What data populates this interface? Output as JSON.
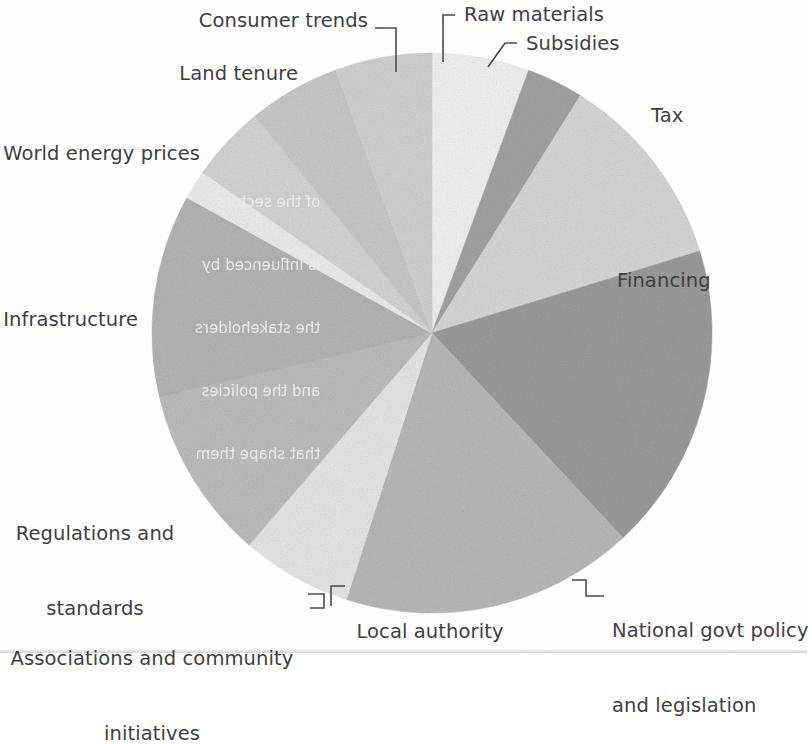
{
  "figure": {
    "type": "pie-chart",
    "background_color": "#ffffff",
    "text_color": "#3f3f3f"
  },
  "chart_data": {
    "type": "pie",
    "title": "",
    "subtitle": "",
    "xlabel": "",
    "ylabel": "",
    "grid": false,
    "legend_position": "none",
    "label_style": "leader-line callouts around pie",
    "start_angle_deg": 0,
    "direction": "clockwise",
    "center_px": [
      432,
      333
    ],
    "radius_px": 280,
    "labels": [
      "Raw materials",
      "Subsidies",
      "Tax",
      "Financing",
      "National govt policy and legislation",
      "Local authority",
      "Associations and community initiatives",
      "Regulations and standards",
      "Infrastructure",
      "World energy prices",
      "Land tenure",
      "Consumer trends"
    ],
    "values": [
      5.6,
      3.3,
      11.4,
      17.8,
      16.9,
      6.4,
      10.0,
      11.7,
      1.7,
      4.4,
      5.3,
      5.5
    ],
    "colors": [
      "#f1f1f1",
      "#a2a2a2",
      "#d7d7d7",
      "#9b9b9b",
      "#b9b9b9",
      "#e7e7e7",
      "#bdbdbd",
      "#b4b4b4",
      "#ededed",
      "#d4d4d4",
      "#c9c9c9",
      "#d1d1d1"
    ],
    "slices": [
      {
        "label": "Raw materials",
        "value": 5.6,
        "color": "#f1f1f1",
        "start_deg": 0.0,
        "end_deg": 20.2
      },
      {
        "label": "Subsidies",
        "value": 3.3,
        "color": "#a2a2a2",
        "start_deg": 20.2,
        "end_deg": 32.0
      },
      {
        "label": "Tax",
        "value": 11.4,
        "color": "#d7d7d7",
        "start_deg": 32.0,
        "end_deg": 73.0
      },
      {
        "label": "Financing",
        "value": 17.8,
        "color": "#9b9b9b",
        "start_deg": 73.0,
        "end_deg": 137.0
      },
      {
        "label": "National govt policy and legislation",
        "value": 16.9,
        "color": "#b9b9b9",
        "start_deg": 137.0,
        "end_deg": 197.8
      },
      {
        "label": "Local authority",
        "value": 6.4,
        "color": "#e7e7e7",
        "start_deg": 197.8,
        "end_deg": 220.8
      },
      {
        "label": "Associations and community initiatives",
        "value": 10.0,
        "color": "#bdbdbd",
        "start_deg": 220.8,
        "end_deg": 256.8
      },
      {
        "label": "Regulations and standards",
        "value": 11.7,
        "color": "#b4b4b4",
        "start_deg": 256.8,
        "end_deg": 298.9
      },
      {
        "label": "Infrastructure",
        "value": 1.7,
        "color": "#ededed",
        "start_deg": 298.9,
        "end_deg": 305.0
      },
      {
        "label": "World energy prices",
        "value": 4.4,
        "color": "#d4d4d4",
        "start_deg": 305.0,
        "end_deg": 320.8
      },
      {
        "label": "Land tenure",
        "value": 5.3,
        "color": "#c9c9c9",
        "start_deg": 320.8,
        "end_deg": 339.9
      },
      {
        "label": "Consumer trends",
        "value": 5.5,
        "color": "#d1d1d1",
        "start_deg": 339.9,
        "end_deg": 360.0
      }
    ]
  },
  "callouts": {
    "consumer_trends": "Consumer trends",
    "raw_materials": "Raw materials",
    "subsidies": "Subsidies",
    "land_tenure": "Land tenure",
    "tax": "Tax",
    "world_energy_prices": "World energy prices",
    "financing": "Financing",
    "infrastructure": "Infrastructure",
    "regulations_line1": "Regulations and",
    "regulations_line2": "standards",
    "national_line1": "National govt policy",
    "national_line2": "and legislation",
    "associations_line1": "Associations and community",
    "associations_line2": "initiatives",
    "local_authority": "Local authority"
  },
  "show_through": {
    "line1": "of the sectors",
    "line2": "is influenced by",
    "line3": "the stakeholders",
    "line4": "and the policies",
    "line5": "that shape them"
  }
}
